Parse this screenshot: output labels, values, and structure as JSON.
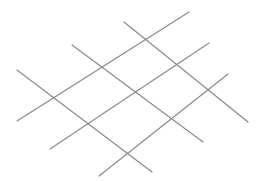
{
  "diagram": {
    "type": "oblique-grid",
    "background": "#ffffff",
    "stroke_color": "#8a8a8a",
    "stroke_width": 1.2,
    "lines_rising": [
      {
        "x1": 17,
        "y1": 121,
        "x2": 189,
        "y2": 12
      },
      {
        "x1": 50,
        "y1": 149,
        "x2": 209,
        "y2": 43
      },
      {
        "x1": 99,
        "y1": 176,
        "x2": 228,
        "y2": 74
      }
    ],
    "lines_falling": [
      {
        "x1": 17,
        "y1": 70,
        "x2": 152,
        "y2": 172
      },
      {
        "x1": 72,
        "y1": 45,
        "x2": 203,
        "y2": 142
      },
      {
        "x1": 124,
        "y1": 22,
        "x2": 248,
        "y2": 122
      }
    ]
  }
}
